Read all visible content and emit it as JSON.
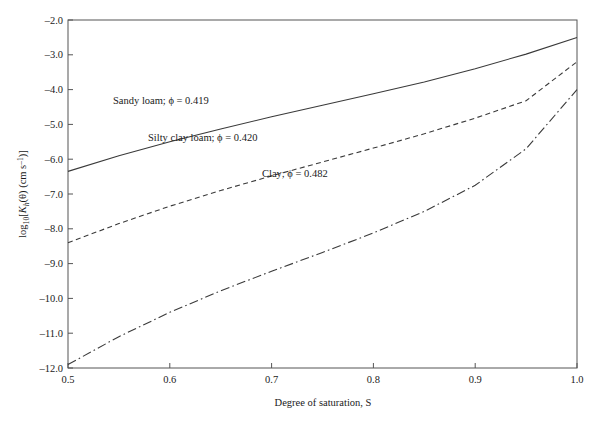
{
  "chart_data": {
    "type": "line",
    "title": "",
    "xlabel": "Degree of saturation, S",
    "ylabel": "log10[Kh(θ) (cm s⁻¹)]",
    "xlim": [
      0.5,
      1.0
    ],
    "ylim": [
      -12.0,
      -2.0
    ],
    "grid": false,
    "legend": "inline-annotations",
    "x_ticks": [
      "0.5",
      "0.6",
      "0.7",
      "0.8",
      "0.9",
      "1.0"
    ],
    "x_tick_values": [
      0.5,
      0.6,
      0.7,
      0.8,
      0.9,
      1.0
    ],
    "y_ticks": [
      "–2.0",
      "–3.0",
      "–4.0",
      "–5.0",
      "–6.0",
      "–7.0",
      "–8.0",
      "–9.0",
      "–10.0",
      "–11.0",
      "–12.0"
    ],
    "y_tick_values": [
      -2.0,
      -3.0,
      -4.0,
      -5.0,
      -6.0,
      -7.0,
      -8.0,
      -9.0,
      -10.0,
      -11.0,
      -12.0
    ],
    "x": [
      0.5,
      0.55,
      0.6,
      0.65,
      0.7,
      0.75,
      0.8,
      0.85,
      0.9,
      0.95,
      1.0
    ],
    "series": [
      {
        "name": "Sandy loam",
        "label": "Sandy loam; ϕ = 0.419",
        "porosity": 0.419,
        "style": "solid",
        "color": "#3a3a3a",
        "values": [
          -6.35,
          -5.9,
          -5.5,
          -5.13,
          -4.78,
          -4.45,
          -4.12,
          -3.78,
          -3.4,
          -2.98,
          -2.5
        ]
      },
      {
        "name": "Silty clay loam",
        "label": "Silty clay loam; ϕ = 0.420",
        "porosity": 0.42,
        "style": "dashed",
        "color": "#3a3a3a",
        "values": [
          -8.4,
          -7.85,
          -7.35,
          -6.9,
          -6.48,
          -6.08,
          -5.68,
          -5.27,
          -4.82,
          -4.32,
          -3.2
        ]
      },
      {
        "name": "Clay",
        "label": "Clay; ϕ = 0.482",
        "porosity": 0.482,
        "style": "dash-dot",
        "color": "#3a3a3a",
        "values": [
          -11.9,
          -11.1,
          -10.4,
          -9.78,
          -9.22,
          -8.68,
          -8.12,
          -7.5,
          -6.75,
          -5.7,
          -4.0
        ]
      }
    ],
    "annotations": [
      {
        "name": "sandy-loam-label",
        "text": "Sandy loam; ϕ = 0.419",
        "x_px": 113,
        "y_px": 104
      },
      {
        "name": "silty-clay-loam-label",
        "text": "Silty clay loam; ϕ = 0.420",
        "x_px": 148,
        "y_px": 141
      },
      {
        "name": "clay-label",
        "text": "Clay; ϕ = 0.482",
        "x_px": 262,
        "y_px": 177
      }
    ]
  },
  "axes": {
    "x_title": "Degree of saturation, S",
    "y_title_parts": {
      "log": "log",
      "base": "10",
      "open": "[",
      "k": "K",
      "sub": "h",
      "theta": "(θ)",
      "units": " (cm s",
      "exp": "–1",
      "close": ")]"
    }
  }
}
